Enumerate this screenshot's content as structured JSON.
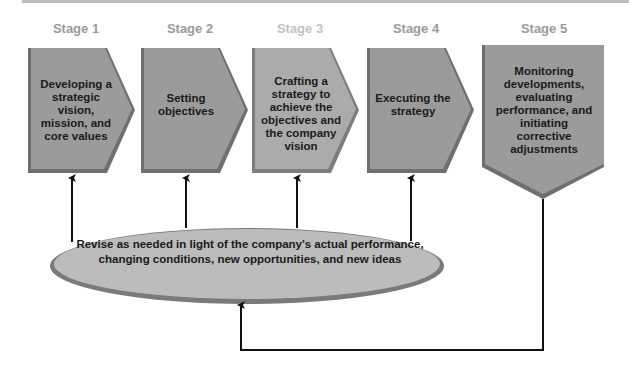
{
  "colors": {
    "box_fill": "#9b9b9b",
    "box_fill_light": "#ababab",
    "box_edge": "#6f6f6f",
    "ellipse_fill": "#bcbcbc",
    "ellipse_edge": "#7a7a7a",
    "stage_label": "#9a9a9a",
    "stage_label_light": "#c2c2c2",
    "arrow": "#111111"
  },
  "stages": [
    {
      "label": "Stage 1",
      "text": "Developing a strategic vision, mission, and core values"
    },
    {
      "label": "Stage 2",
      "text": "Setting objectives"
    },
    {
      "label": "Stage 3",
      "text": "Crafting a strategy to achieve the objectives and the company vision"
    },
    {
      "label": "Stage 4",
      "text": "Executing the strategy"
    },
    {
      "label": "Stage 5",
      "text": "Monitoring developments, evaluating performance, and initiating corrective adjustments"
    }
  ],
  "feedback": {
    "text": "Revise as needed in light of the company's actual performance, changing conditions, new opportunities, and new ideas"
  }
}
